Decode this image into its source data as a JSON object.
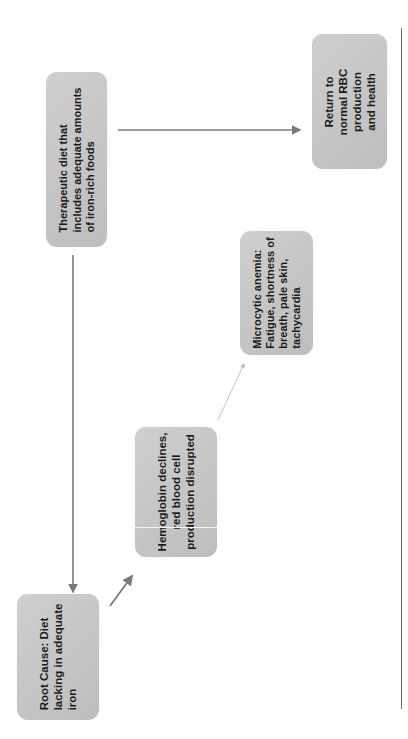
{
  "diagram": {
    "type": "flowchart",
    "orientation": "rotated-90-ccw",
    "colors": {
      "node_fill": "#c6c6c6",
      "node_text": "#1c1c1c",
      "arrow": "#7a7a7a",
      "faint_arrow": "#bdbdbd",
      "page_rule": "#6a6a6a"
    },
    "nodes": [
      {
        "id": "root-cause",
        "label": "Root Cause: Diet\nlacking in adequate\niron"
      },
      {
        "id": "hemoglobin",
        "label": "Hemoglobin declines,\nred blood cell\nproduction disrupted"
      },
      {
        "id": "anemia",
        "label": "Microcytic anemia:\nFatigue, shortness of\nbreath, pale skin,\ntachycardia"
      },
      {
        "id": "therapeutic-diet",
        "label": "Therapeutic diet that\nincludes adequate amounts\nof iron-rich foods"
      },
      {
        "id": "return-normal",
        "label": "Return to\nnormal RBC\nproduction\nand health"
      }
    ],
    "edges": [
      {
        "from": "root-cause",
        "to": "hemoglobin"
      },
      {
        "from": "hemoglobin",
        "to": "anemia"
      },
      {
        "from": "therapeutic-diet",
        "to": "root-cause"
      },
      {
        "from": "therapeutic-diet",
        "to": "return-normal"
      }
    ]
  }
}
